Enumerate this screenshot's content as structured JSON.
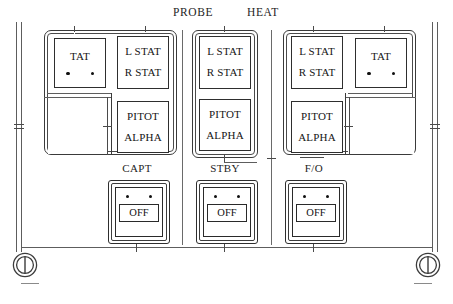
{
  "panel": {
    "title_left": "PROBE",
    "title_right": "HEAT",
    "caption": ""
  },
  "groups": [
    {
      "name": "capt-group",
      "position": "left",
      "boxes": [
        {
          "id": "tat-left",
          "labels": [
            "TAT"
          ],
          "indicators": 2
        },
        {
          "id": "stat-left",
          "labels": [
            "L STAT",
            "R STAT"
          ],
          "indicators": 0
        },
        {
          "id": "pitot-left",
          "labels": [
            "PITOT",
            "ALPHA"
          ],
          "indicators": 0
        }
      ]
    },
    {
      "name": "stby-group",
      "position": "center",
      "boxes": [
        {
          "id": "stat-center",
          "labels": [
            "L STAT",
            "R STAT"
          ],
          "indicators": 0
        },
        {
          "id": "pitot-center",
          "labels": [
            "PITOT",
            "ALPHA"
          ],
          "indicators": 0
        }
      ]
    },
    {
      "name": "fo-group",
      "position": "right",
      "boxes": [
        {
          "id": "stat-right",
          "labels": [
            "L STAT",
            "R STAT"
          ],
          "indicators": 0
        },
        {
          "id": "tat-right",
          "labels": [
            "TAT"
          ],
          "indicators": 2
        },
        {
          "id": "pitot-right",
          "labels": [
            "PITOT",
            "ALPHA"
          ],
          "indicators": 0
        }
      ]
    }
  ],
  "switches": [
    {
      "id": "switch-capt",
      "caption": "CAPT",
      "off_label": "OFF",
      "indicators": 2
    },
    {
      "id": "switch-stby",
      "caption": "STBY",
      "off_label": "OFF",
      "indicators": 2
    },
    {
      "id": "switch-fo",
      "caption": "F/O",
      "off_label": "OFF",
      "indicators": 2
    }
  ],
  "colors": {
    "line": "#2e2e2e",
    "rail": "#5d5d5d",
    "text": "#151515",
    "background": "#ffffff"
  }
}
